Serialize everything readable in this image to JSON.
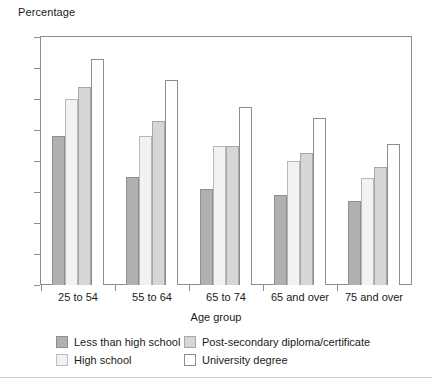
{
  "chart_data": {
    "type": "bar",
    "title": "",
    "ylabel": "Percentage",
    "xlabel": "Age group",
    "ylim": [
      0,
      80
    ],
    "yticks": [
      0,
      10,
      20,
      30,
      40,
      50,
      60,
      70,
      80
    ],
    "grid": false,
    "legend_position": "bottom",
    "categories": [
      "25 to 54",
      "55 to 64",
      "65 to 74",
      "65 and over",
      "75 and over"
    ],
    "series": [
      {
        "name": "Less than high school",
        "color": "#b0b0b0",
        "values": [
          48,
          35,
          31,
          29,
          27
        ]
      },
      {
        "name": "High school",
        "color": "#f2f2f2",
        "values": [
          60,
          48,
          45,
          40,
          34.5
        ]
      },
      {
        "name": "Post-secondary diploma/certificate",
        "color": "#d6d6d6",
        "values": [
          64,
          53,
          45,
          42.5,
          38
        ]
      },
      {
        "name": "University degree",
        "color": "#ffffff",
        "values": [
          73,
          66,
          57.5,
          54,
          45.5
        ]
      }
    ]
  },
  "axes": {
    "y_title": "Percentage",
    "x_title": "Age group",
    "tick_labels": [
      "80",
      "70",
      "60",
      "50",
      "40",
      "30",
      "20",
      "10",
      "0"
    ],
    "category_labels": [
      "25 to 54",
      "55 to 64",
      "65 to 74",
      "65 and over",
      "75 and over"
    ]
  },
  "legend": {
    "items": [
      {
        "label": "Less than high school",
        "swatch": "s0"
      },
      {
        "label": "Post-secondary diploma/certificate",
        "swatch": "s2"
      },
      {
        "label": "High school",
        "swatch": "s1"
      },
      {
        "label": "University degree",
        "swatch": "s3"
      }
    ]
  }
}
